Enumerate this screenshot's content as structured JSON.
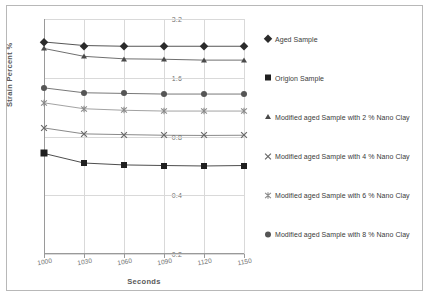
{
  "chart_data": {
    "type": "line",
    "title": "",
    "xlabel": "Seconds",
    "ylabel": "Strain Percent  %",
    "x": [
      1000,
      1030,
      1060,
      1090,
      1120,
      1150
    ],
    "xtick_labels": [
      "1000",
      "1030",
      "1060",
      "1090",
      "1120",
      "1150"
    ],
    "ytick_labels": [
      "0.2",
      "0.4",
      "0.8",
      "1.6",
      "3.2"
    ],
    "ytick_values": [
      0.2,
      0.4,
      0.8,
      1.6,
      3.2
    ],
    "yscale": "log2",
    "ylim": [
      0.2,
      3.2
    ],
    "xlim": [
      1000,
      1150
    ],
    "grid": true,
    "legend_position": "right",
    "series": [
      {
        "name": "Aged Sample",
        "marker": "diamond",
        "color": "#2b2b2b",
        "values": [
          2.44,
          2.34,
          2.32,
          2.32,
          2.32,
          2.32
        ]
      },
      {
        "name": "Origion Sample",
        "marker": "square",
        "color": "#1f1f1f",
        "values": [
          0.655,
          0.585,
          0.572,
          0.568,
          0.565,
          0.568
        ]
      },
      {
        "name": "Modified aged Sample with 2 % Nano Clay",
        "marker": "triangle",
        "color": "#4a4a4a",
        "values": [
          2.26,
          2.06,
          2.0,
          1.99,
          1.97,
          1.97
        ]
      },
      {
        "name": "Modified aged Sample with 4 % Nano Clay",
        "marker": "x",
        "color": "#6b6b6b",
        "values": [
          0.885,
          0.825,
          0.818,
          0.812,
          0.81,
          0.812
        ]
      },
      {
        "name": "Modified aged Sample with 6 % Nano Clay",
        "marker": "star",
        "color": "#8a8a8a",
        "values": [
          1.19,
          1.11,
          1.09,
          1.08,
          1.08,
          1.08
        ]
      },
      {
        "name": "Modified aged Sample with 8 % Nano Clay",
        "marker": "circle",
        "color": "#555555",
        "values": [
          1.42,
          1.34,
          1.33,
          1.32,
          1.32,
          1.32
        ]
      }
    ]
  }
}
